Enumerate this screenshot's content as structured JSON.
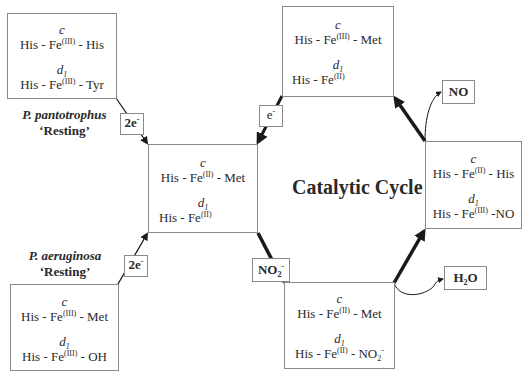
{
  "title": "Catalytic Cycle",
  "states": {
    "pantotrophus_resting": {
      "heme_c_label": "c",
      "heme_c": {
        "pre": "His - Fe",
        "ox": "(III)",
        "post": " - His"
      },
      "heme_d1_label": "d",
      "heme_d1_sub": "1",
      "heme_d1": {
        "pre": "His - Fe",
        "ox": "(III)",
        "post": " - Tyr"
      }
    },
    "reduced": {
      "heme_c_label": "c",
      "heme_c": {
        "pre": "His - Fe",
        "ox": "(II)",
        "post": " - Met"
      },
      "heme_d1_label": "d",
      "heme_d1_sub": "1",
      "heme_d1": {
        "pre": "His - Fe",
        "ox": "(II)",
        "post": ""
      }
    },
    "top": {
      "heme_c_label": "c",
      "heme_c": {
        "pre": "His - Fe",
        "ox": "(III)",
        "post": " - Met"
      },
      "heme_d1_label": "d",
      "heme_d1_sub": "1",
      "heme_d1": {
        "pre": "His - Fe",
        "ox": "(II)",
        "post": ""
      }
    },
    "nitrosyl": {
      "heme_c_label": "c",
      "heme_c": {
        "pre": "His - Fe",
        "ox": "(II)",
        "post": " - His"
      },
      "heme_d1_label": "d",
      "heme_d1_sub": "1",
      "heme_d1": {
        "pre": "His - Fe",
        "ox": "(III)",
        "post": " -NO"
      }
    },
    "nitrite_bound": {
      "heme_c_label": "c",
      "heme_c": {
        "pre": "His - Fe",
        "ox": "(II)",
        "post": " - Met"
      },
      "heme_d1_label": "d",
      "heme_d1_sub": "1",
      "heme_d1": {
        "pre": "His - Fe",
        "ox": "(II)",
        "post": " - NO",
        "post_sub": "2",
        "post_sup": "-"
      }
    },
    "aeruginosa_resting": {
      "heme_c_label": "c",
      "heme_c": {
        "pre": "His - Fe",
        "ox": "(III)",
        "post": " - Met"
      },
      "heme_d1_label": "d",
      "heme_d1_sub": "1",
      "heme_d1": {
        "pre": "His - Fe",
        "ox": "(III)",
        "post": " - OH"
      }
    }
  },
  "species": {
    "pantotrophus": {
      "name": "P. pantotrophus",
      "state": "‘Resting’"
    },
    "aeruginosa": {
      "name": "P. aeruginosa",
      "state": "‘Resting’"
    }
  },
  "labels": {
    "two_e_top": {
      "base": "2e",
      "sup": "-"
    },
    "two_e_bottom": {
      "base": "2e",
      "sup": "-"
    },
    "one_e": {
      "base": "e",
      "sup": "-"
    },
    "nitrite": {
      "base": "NO",
      "sub": "2",
      "sup": "-"
    },
    "no": {
      "base": "NO"
    },
    "water": {
      "pre": "H",
      "sub": "2",
      "post": "O"
    }
  }
}
